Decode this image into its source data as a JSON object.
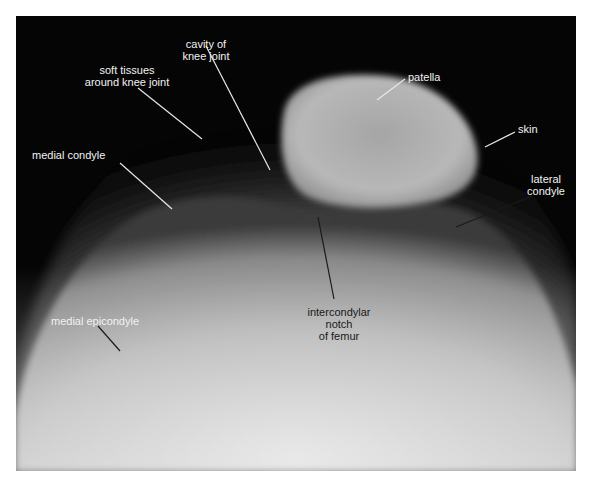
{
  "figure": {
    "labels": {
      "cavity": "cavity of knee joint",
      "cavity_l1": "cavity of",
      "cavity_l2": "knee joint",
      "soft_l1": "soft tissues",
      "soft_l2": "around knee joint",
      "patella": "patella",
      "skin": "skin",
      "medial_condyle": "medial condyle",
      "lateral_l1": "lateral",
      "lateral_l2": "condyle",
      "notch_l1": "intercondylar",
      "notch_l2": "notch",
      "notch_l3": "of femur",
      "medial_epicondyle": "medial epicondyle"
    },
    "colors": {
      "background": "#050505",
      "bone_light": "#c8c8c8",
      "label_light": "#f2f2f2",
      "label_dark": "#1a1a1a"
    }
  }
}
